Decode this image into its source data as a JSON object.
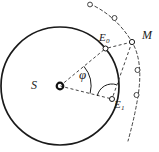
{
  "figure": {
    "kind": "geometry-diagram",
    "width": 159,
    "height": 152,
    "background_color": "#ffffff",
    "stroke_color": "#1a1a1a",
    "labels": {
      "center": "S",
      "angle": "φ",
      "point_upper": "E",
      "point_upper_sub": "0",
      "point_lower": "E",
      "point_lower_sub": "1",
      "point_moving": "M"
    },
    "geometry": {
      "circle": {
        "cx": 60,
        "cy": 86,
        "r": 59,
        "stroke_width": 1.7,
        "dashed": false
      },
      "center_marker": {
        "cx": 60,
        "cy": 86,
        "outer_r": 4.1,
        "inner_r": 1.5
      },
      "point_E0": {
        "cx": 105.5,
        "cy": 48.5,
        "marker_r": 2.5
      },
      "point_E1": {
        "cx": 112.0,
        "cy": 99.0,
        "marker_r": 2.5
      },
      "point_M": {
        "cx": 132.0,
        "cy": 42.0,
        "marker_r": 2.6
      },
      "ray_S_E0": {
        "x1": 60,
        "y1": 86,
        "x2": 105.5,
        "y2": 48.5,
        "dashed": true
      },
      "ray_S_E1": {
        "x1": 60,
        "y1": 86,
        "x2": 112.0,
        "y2": 99.0,
        "dashed": true
      },
      "chord_M_E0": {
        "x1": 132.0,
        "y1": 42.0,
        "x2": 105.5,
        "y2": 48.5,
        "dashed": true
      },
      "chord_M_E1": {
        "x1": 132.0,
        "y1": 42.0,
        "x2": 112.0,
        "y2": 99.0,
        "dashed": true
      },
      "angle_arc_phi": {
        "cx": 60,
        "cy": 86,
        "r": 31,
        "from_deg": -39.5,
        "to_deg": 14.0
      },
      "angle_arc_E1": {
        "cx": 112.0,
        "cy": 99.0,
        "r": 15,
        "from_deg": -168.0,
        "to_deg": -72.0
      },
      "dashed_trajectory": {
        "path": "M 90 4 C 104 10, 120 22, 132 42 C 141 57, 141 78, 138 96 C 135 115, 131 130, 128 141",
        "dashed": true
      },
      "trajectory_markers": [
        {
          "cx": 90.0,
          "cy": 4.5,
          "r": 2.4
        },
        {
          "cx": 114.5,
          "cy": 18.0,
          "r": 2.5
        },
        {
          "cx": 137.5,
          "cy": 70.0,
          "r": 2.5
        },
        {
          "cx": 136.5,
          "cy": 95.0,
          "r": 2.5
        }
      ]
    }
  }
}
